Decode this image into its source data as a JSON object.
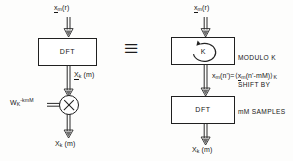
{
  "diagram": {
    "equivalence_symbol": "≡",
    "left": {
      "input_label": {
        "base": "x",
        "sub": "m",
        "arg": "(r)",
        "underlined": true
      },
      "block_label": "DFT",
      "intermediate_label": {
        "base": "X",
        "sub": "k",
        "arg": "(m)",
        "underlined": true
      },
      "twiddle_label": {
        "base": "W",
        "sub": "K",
        "sup": "-kmM"
      },
      "multiplier_symbol": "⊗",
      "output_label": {
        "base": "X",
        "sub": "k",
        "arg": "(m)",
        "underlined": false
      }
    },
    "right": {
      "input_label": {
        "base": "x",
        "sub": "m",
        "arg": "(r)",
        "underlined": true
      },
      "shift_block_symbol": "K",
      "shift_caption_lines": [
        "MODULO K",
        "SHIFT BY",
        "mM SAMPLES"
      ],
      "equation": {
        "lhs_base": "x",
        "lhs_sub": "m",
        "lhs_arg": "(n')",
        "equals": "=",
        "rhs_open": "⟨",
        "rhs_base": "x",
        "rhs_sub": "m",
        "rhs_arg": "(n'-mM)",
        "rhs_close": "⟩",
        "rhs_mod": "K"
      },
      "block_label": "DFT",
      "output_label": {
        "base": "X",
        "sub": "k",
        "arg": "(m)",
        "underlined": false
      }
    }
  },
  "colors": {
    "ink": "#161616",
    "stroke": "#202020",
    "background": "#fdfdfc"
  }
}
